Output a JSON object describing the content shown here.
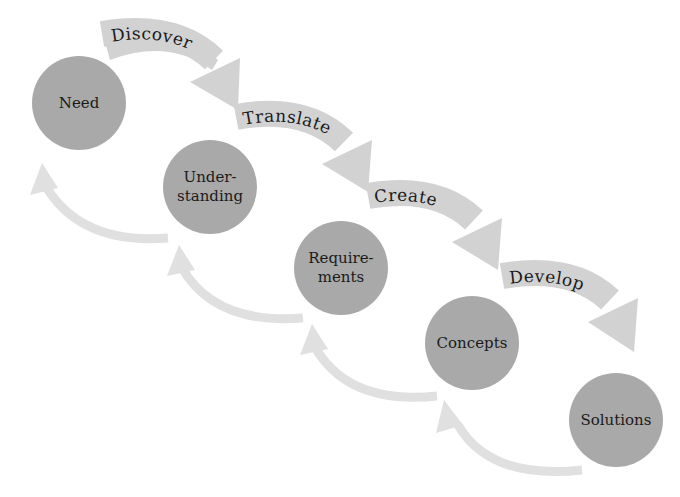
{
  "colors": {
    "node_fill": "#a9a9a9",
    "forward_arrow": "#d2d2d2",
    "back_arrow": "#e0e0e0",
    "text": "#1a1a1a",
    "background": "#ffffff"
  },
  "nodes": [
    {
      "id": "need",
      "lines": [
        "Need"
      ]
    },
    {
      "id": "understanding",
      "lines": [
        "Under-",
        "standing"
      ]
    },
    {
      "id": "requirements",
      "lines": [
        "Require-",
        "ments"
      ]
    },
    {
      "id": "concepts",
      "lines": [
        "Concepts"
      ]
    },
    {
      "id": "solutions",
      "lines": [
        "Solutions"
      ]
    }
  ],
  "forward_arrows": [
    {
      "label": "Discover",
      "from": "need",
      "to": "understanding"
    },
    {
      "label": "Translate",
      "from": "understanding",
      "to": "requirements"
    },
    {
      "label": "Create",
      "from": "requirements",
      "to": "concepts"
    },
    {
      "label": "Develop",
      "from": "concepts",
      "to": "solutions"
    }
  ],
  "back_arrows": [
    {
      "from": "understanding",
      "to": "need"
    },
    {
      "from": "requirements",
      "to": "understanding"
    },
    {
      "from": "concepts",
      "to": "requirements"
    },
    {
      "from": "solutions",
      "to": "concepts"
    }
  ]
}
